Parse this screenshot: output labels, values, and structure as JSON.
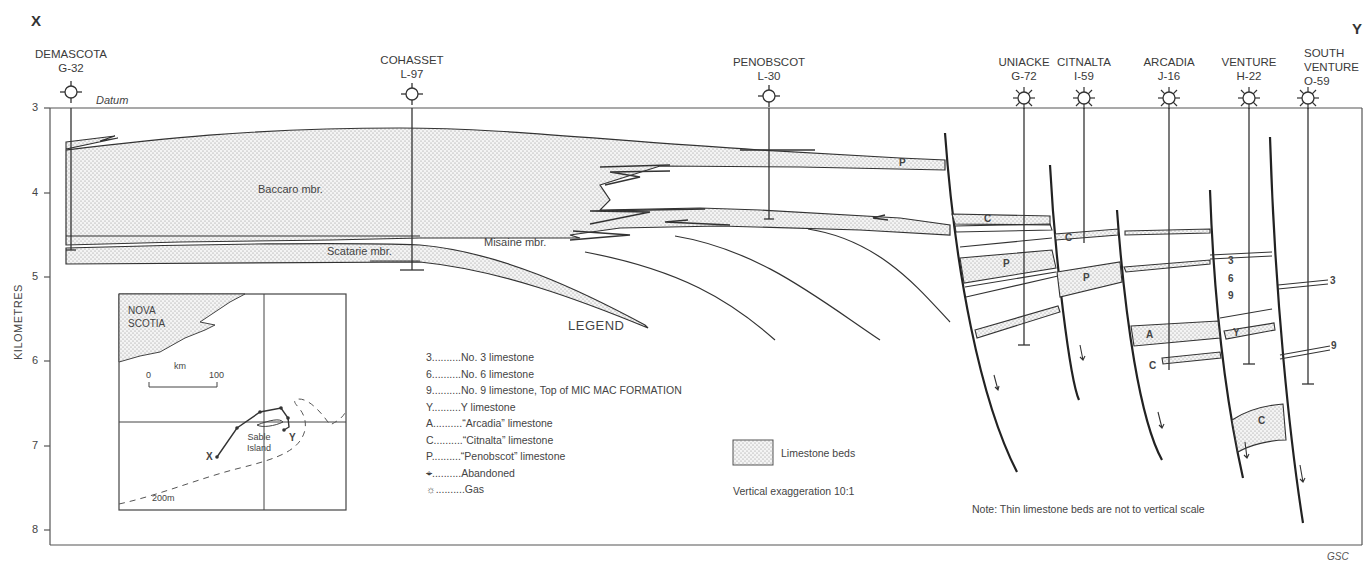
{
  "section": {
    "start_label": "X",
    "end_label": "Y",
    "datum_label": "Datum",
    "y_axis": {
      "title": "KILOMETRES",
      "ticks": [
        "3",
        "4",
        "5",
        "6",
        "7",
        "8"
      ]
    },
    "credit": "GSC"
  },
  "wells": [
    {
      "name": "DEMASCOTA",
      "id": "G-32",
      "status": "abandoned"
    },
    {
      "name": "COHASSET",
      "id": "L-97",
      "status": "abandoned"
    },
    {
      "name": "PENOBSCOT",
      "id": "L-30",
      "status": "abandoned"
    },
    {
      "name": "UNIACKE",
      "id": "G-72",
      "status": "gas"
    },
    {
      "name": "CITNALTA",
      "id": "I-59",
      "status": "gas"
    },
    {
      "name": "ARCADIA",
      "id": "J-16",
      "status": "gas"
    },
    {
      "name": "VENTURE",
      "id": "H-22",
      "status": "gas"
    },
    {
      "name": "SOUTH VENTURE",
      "name_line1": "SOUTH",
      "name_line2": "VENTURE",
      "id": "O-59",
      "status": "gas"
    }
  ],
  "members": {
    "baccaro": "Baccaro mbr.",
    "scatarie": "Scatarie mbr.",
    "misaine": "Misaine mbr."
  },
  "bed_labels": {
    "p1": "P",
    "c1": "C",
    "c2": "C",
    "p2": "P",
    "p3": "P",
    "a1": "A",
    "c3": "C",
    "y1": "Y",
    "c4": "C",
    "n3a": "3",
    "n6": "6",
    "n9a": "9",
    "n3b": "3",
    "n9b": "9"
  },
  "legend": {
    "title": "LEGEND",
    "items": [
      {
        "key": "3",
        "dots": "..........",
        "label": "No. 3 limestone"
      },
      {
        "key": "6",
        "dots": "..........",
        "label": "No. 6 limestone"
      },
      {
        "key": "9",
        "dots": "..........",
        "label": "No. 9 limestone, Top of MIC MAC FORMATION"
      },
      {
        "key": "Y",
        "dots": "..........",
        "label": "Y limestone"
      },
      {
        "key": "A",
        "dots": "..........",
        "label": "“Arcadia” limestone"
      },
      {
        "key": "C",
        "dots": "..........",
        "label": "“Citnalta” limestone"
      },
      {
        "key": "P",
        "dots": "..........",
        "label": "“Penobscot” limestone"
      },
      {
        "key": "abandoned-symbol",
        "dots": "..........",
        "label": "Abandoned"
      },
      {
        "key": "gas-symbol",
        "dots": "..........",
        "label": "Gas"
      }
    ],
    "pattern_label": "Limestone beds",
    "exaggeration": "Vertical exaggeration 10:1"
  },
  "note": "Note: Thin limestone beds are not to vertical scale",
  "inset_map": {
    "region_line1": "NOVA",
    "region_line2": "SCOTIA",
    "scale_unit": "km",
    "scale_min": "0",
    "scale_max": "100",
    "island_line1": "Sable",
    "island_line2": "Island",
    "isobath": "200m",
    "point_x": "X",
    "point_y": "Y"
  }
}
